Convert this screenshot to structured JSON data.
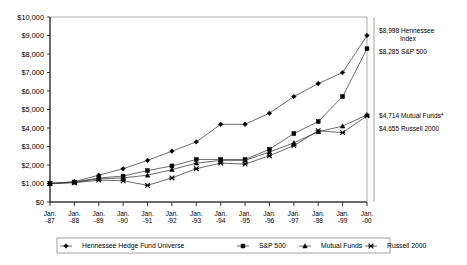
{
  "chart_data": {
    "type": "line",
    "title": "",
    "xlabel": "",
    "ylabel": "",
    "ylim": [
      0,
      10000
    ],
    "ytick_step": 1000,
    "grid": false,
    "legend_position": "bottom",
    "categories": [
      "Jan. -87",
      "Jan. -88",
      "Jan. -89",
      "Jan. -90",
      "Jan. -91",
      "Jan. -92",
      "Jan. -93",
      "Jan. -94",
      "Jan. -95",
      "Jan. -96",
      "Jan. -97",
      "Jan. -98",
      "Jan. -99",
      "Jan. -00"
    ],
    "ytick_labels": [
      "$0",
      "$1,000",
      "$2,000",
      "$3,000",
      "$4,000",
      "$5,000",
      "$6,000",
      "$7,000",
      "$8,000",
      "$9,000",
      "$10,000"
    ],
    "ytick_values": [
      0,
      1000,
      2000,
      3000,
      4000,
      5000,
      6000,
      7000,
      8000,
      9000,
      10000
    ],
    "series": [
      {
        "name": "Hennessee Hedge Fund Universe",
        "marker": "diamond",
        "values": [
          1000,
          1100,
          1450,
          1800,
          2250,
          2750,
          3250,
          4200,
          4200,
          4800,
          5700,
          6400,
          7000,
          8998
        ]
      },
      {
        "name": "S&P 500",
        "marker": "square",
        "values": [
          1000,
          1080,
          1300,
          1400,
          1700,
          1950,
          2300,
          2300,
          2300,
          2850,
          3700,
          4350,
          5700,
          8285
        ]
      },
      {
        "name": "Mutual Funds",
        "marker": "triangle",
        "values": [
          1000,
          1060,
          1250,
          1300,
          1450,
          1750,
          2100,
          2250,
          2250,
          2700,
          3200,
          3800,
          4100,
          4714
        ]
      },
      {
        "name": "Russell 2000",
        "marker": "cross",
        "values": [
          1000,
          1040,
          1180,
          1150,
          900,
          1300,
          1800,
          2100,
          2050,
          2500,
          3050,
          3850,
          3750,
          4655
        ]
      }
    ]
  },
  "legend": {
    "items": [
      {
        "label": "Hennessee Hedge Fund Universe",
        "marker": "diamond"
      },
      {
        "label": "S&P 500",
        "marker": "square"
      },
      {
        "label": "Mutual Funds",
        "marker": "triangle"
      },
      {
        "label": "Russell 2000",
        "marker": "cross"
      }
    ]
  },
  "annotations": {
    "top": [
      {
        "line1": "$8,998 Hennessee",
        "line2": "Index"
      },
      {
        "line1": "$8,285 S&P 500",
        "line2": ""
      }
    ],
    "bottom": [
      {
        "line1": "$4,714 Mutual Funds*",
        "line2": ""
      },
      {
        "line1": "$4,655 Russell 2000",
        "line2": ""
      }
    ]
  }
}
